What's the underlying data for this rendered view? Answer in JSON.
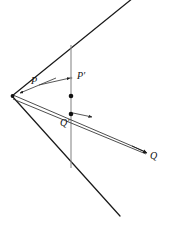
{
  "figure": {
    "colors": {
      "stroke_dark": "#1a1a1a",
      "stroke_gray": "#8a8a8a",
      "stroke_mid": "#4a4a4a",
      "background": "#ffffff",
      "label_color": "#121212"
    },
    "labels": {
      "p": "P",
      "p_prime": "P′",
      "q": "Q",
      "q_prime": "Q′"
    },
    "geometry": {
      "vertex": {
        "x": 12,
        "y": 96
      },
      "upper_ray_end": {
        "x": 133,
        "y": -2
      },
      "lower_ray_end": {
        "x": 120,
        "y": 216
      },
      "vertical_line": {
        "x": 71,
        "y_top": 45,
        "y_bottom": 168
      },
      "p_point": {
        "x": 41,
        "y": 88
      },
      "p_prime_point": {
        "x": 71,
        "y": 78
      },
      "q_point": {
        "x": 146,
        "y": 152
      },
      "q_prime_point": {
        "x": 71,
        "y": 114
      },
      "mid_dot": {
        "x": 71,
        "y": 96
      },
      "inner_arrow_tip": {
        "x": 81,
        "y": 113
      }
    },
    "label_positions": {
      "p": {
        "x": 31,
        "y": 76
      },
      "p_prime": {
        "x": 77,
        "y": 71
      },
      "q": {
        "x": 150,
        "y": 151
      },
      "q_prime": {
        "x": 60,
        "y": 118
      }
    }
  },
  "caption": {
    "text": "· · ·· ·· ·· · ··· ···· ·· ·· ··"
  }
}
